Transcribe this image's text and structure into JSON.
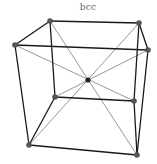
{
  "diagram": {
    "title": "bcc",
    "colors": {
      "edge": "#1a1a1a",
      "diagonal": "#6a6a6a",
      "corner_atom": "#555555",
      "center_atom": "#222222",
      "title": "#666666"
    },
    "vertices": {
      "top_back_left": [
        50,
        21
      ],
      "top_back_right": [
        139,
        23
      ],
      "top_front_left": [
        15,
        45
      ],
      "top_front_right": [
        148,
        50
      ],
      "bottom_back_left": [
        55,
        97
      ],
      "bottom_back_right": [
        134,
        101
      ],
      "bottom_front_left": [
        29,
        145
      ],
      "bottom_front_right": [
        137,
        155
      ],
      "center": [
        88,
        80
      ]
    },
    "edges": [
      [
        "top_back_left",
        "top_back_right"
      ],
      [
        "top_back_right",
        "top_front_right"
      ],
      [
        "top_front_right",
        "top_front_left"
      ],
      [
        "top_front_left",
        "top_back_left"
      ],
      [
        "bottom_back_left",
        "bottom_back_right"
      ],
      [
        "bottom_back_right",
        "bottom_front_right"
      ],
      [
        "bottom_front_right",
        "bottom_front_left"
      ],
      [
        "bottom_front_left",
        "bottom_back_left"
      ],
      [
        "top_back_left",
        "bottom_back_left"
      ],
      [
        "top_back_right",
        "bottom_back_right"
      ],
      [
        "top_front_left",
        "bottom_front_left"
      ],
      [
        "top_front_right",
        "bottom_front_right"
      ]
    ],
    "body_diagonals": [
      [
        "top_back_left",
        "bottom_front_right"
      ],
      [
        "top_back_right",
        "bottom_front_left"
      ],
      [
        "top_front_left",
        "bottom_back_right"
      ],
      [
        "top_front_right",
        "bottom_back_left"
      ]
    ]
  }
}
